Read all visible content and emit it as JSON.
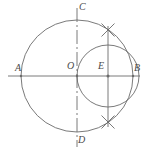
{
  "figure": {
    "background_color": "#ffffff",
    "stroke_color": "#6b6b6b",
    "label_color": "#4a4a4a",
    "labels": [
      {
        "id": "A",
        "text": "A",
        "x": 15,
        "y": 64
      },
      {
        "id": "B",
        "text": "B",
        "x": 134,
        "y": 64
      },
      {
        "id": "C",
        "text": "C",
        "x": 79,
        "y": 3
      },
      {
        "id": "D",
        "text": "D",
        "x": 78,
        "y": 136
      },
      {
        "id": "O",
        "text": "O",
        "x": 67,
        "y": 62
      },
      {
        "id": "E",
        "text": "E",
        "x": 98,
        "y": 62
      }
    ],
    "points": [
      {
        "id": "A",
        "x": 21,
        "y": 76
      },
      {
        "id": "B",
        "x": 133,
        "y": 76
      },
      {
        "id": "O",
        "x": 77,
        "y": 76
      },
      {
        "id": "E",
        "x": 108,
        "y": 76
      },
      {
        "id": "C",
        "x": 77,
        "y": 16
      },
      {
        "id": "D",
        "x": 77,
        "y": 146
      },
      {
        "id": "P-upper",
        "x": 108,
        "y": 30
      },
      {
        "id": "P-lower",
        "x": 108,
        "y": 122
      }
    ],
    "circles": [
      {
        "id": "main-circle",
        "cx": 77,
        "cy": 76,
        "r": 56,
        "style": "solid"
      },
      {
        "id": "secondary-circle",
        "cx": 108,
        "cy": 76,
        "r": 31,
        "style": "solid"
      }
    ],
    "lines": [
      {
        "id": "axis-AB",
        "x1": 8,
        "y1": 76,
        "x2": 140,
        "y2": 76,
        "style": "solid"
      },
      {
        "id": "axis-CD",
        "x1": 77,
        "y1": 8,
        "x2": 77,
        "y2": 147,
        "style": "dash-dot"
      },
      {
        "id": "chord-vertical-E",
        "x1": 108,
        "y1": 26,
        "x2": 108,
        "y2": 127,
        "style": "solid"
      }
    ],
    "intersection_marks": [
      {
        "id": "mark-upper",
        "cx": 108,
        "cy": 30,
        "size": 9
      },
      {
        "id": "mark-lower",
        "cx": 108,
        "cy": 122,
        "size": 9
      }
    ],
    "node_dots": [
      {
        "id": "dot-A",
        "cx": 21,
        "cy": 76,
        "r": 1.2
      },
      {
        "id": "dot-O",
        "cx": 77,
        "cy": 76,
        "r": 1.2
      },
      {
        "id": "dot-E",
        "cx": 108,
        "cy": 76,
        "r": 1.4
      },
      {
        "id": "dot-B",
        "cx": 133,
        "cy": 76,
        "r": 1.2
      }
    ]
  }
}
